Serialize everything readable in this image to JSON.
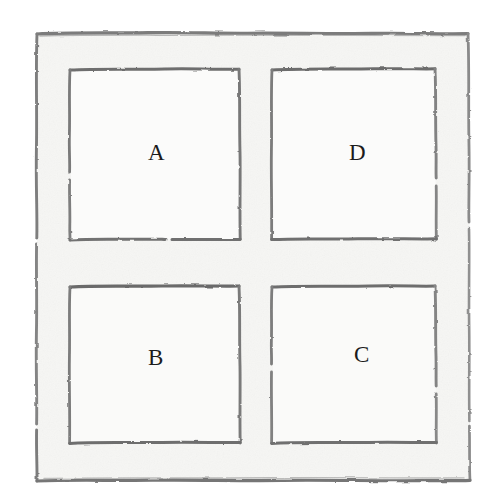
{
  "figure": {
    "kind": "hand-drawn-diagram",
    "medium": "pencil sketch on paper",
    "outer_square": {
      "name": "outer-square",
      "x": 36,
      "y": 33,
      "width": 434,
      "height": 448
    },
    "cells": [
      {
        "id": "a",
        "label": "A",
        "position": "top-left",
        "x": 70,
        "y": 69,
        "width": 170,
        "height": 171,
        "label_x": 155,
        "label_y": 153
      },
      {
        "id": "d",
        "label": "D",
        "position": "top-right",
        "x": 272,
        "y": 68,
        "width": 164,
        "height": 172,
        "label_x": 356,
        "label_y": 153
      },
      {
        "id": "b",
        "label": "B",
        "position": "bottom-left",
        "x": 70,
        "y": 286,
        "width": 170,
        "height": 158,
        "label_x": 155,
        "label_y": 358
      },
      {
        "id": "c",
        "label": "C",
        "position": "bottom-right",
        "x": 272,
        "y": 286,
        "width": 164,
        "height": 158,
        "label_x": 362,
        "label_y": 355
      }
    ],
    "colors": {
      "page_background": "#ffffff",
      "paper_fill": "#f7f7f5",
      "inner_fill": "#fafafa",
      "stroke_dark": "#6b6b6b",
      "stroke_light": "#9a9a9a",
      "label_text": "#1c1c1c"
    }
  }
}
